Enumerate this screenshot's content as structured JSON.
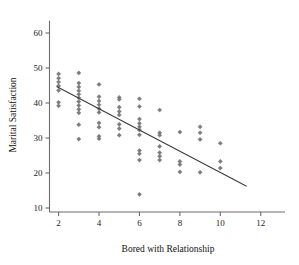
{
  "chart_data": {
    "type": "scatter",
    "title": "",
    "xlabel": "Bored with Relationship",
    "ylabel": "Marital Satisfaction",
    "xlim": [
      1.55,
      13.2
    ],
    "ylim": [
      7.0,
      63.5
    ],
    "xticks": [
      2,
      4,
      6,
      8,
      10,
      12
    ],
    "xtick_labels": [
      "2",
      "4",
      "6",
      "8",
      "10",
      "12"
    ],
    "yticks": [
      10,
      20,
      30,
      40,
      50,
      60
    ],
    "ytick_labels": [
      "10",
      "20",
      "30",
      "40",
      "50",
      "60"
    ],
    "grid": false,
    "legend": null,
    "marker": "diamond",
    "marker_color": "#7d7d7d",
    "points": [
      {
        "x": 2,
        "y": 48.3
      },
      {
        "x": 2,
        "y": 47.1
      },
      {
        "x": 2,
        "y": 46.0
      },
      {
        "x": 2,
        "y": 44.9
      },
      {
        "x": 2,
        "y": 43.6
      },
      {
        "x": 2,
        "y": 40.2
      },
      {
        "x": 2,
        "y": 39.2
      },
      {
        "x": 3,
        "y": 48.6
      },
      {
        "x": 3,
        "y": 45.7
      },
      {
        "x": 3,
        "y": 44.6
      },
      {
        "x": 3,
        "y": 43.5
      },
      {
        "x": 3,
        "y": 42.5
      },
      {
        "x": 3,
        "y": 41.5
      },
      {
        "x": 3,
        "y": 40.4
      },
      {
        "x": 3,
        "y": 39.3
      },
      {
        "x": 3,
        "y": 38.2
      },
      {
        "x": 3,
        "y": 37.2
      },
      {
        "x": 3,
        "y": 33.8
      },
      {
        "x": 3,
        "y": 29.7
      },
      {
        "x": 4,
        "y": 45.3
      },
      {
        "x": 4,
        "y": 41.8
      },
      {
        "x": 4,
        "y": 40.6
      },
      {
        "x": 4,
        "y": 39.5
      },
      {
        "x": 4,
        "y": 38.4
      },
      {
        "x": 4,
        "y": 37.3
      },
      {
        "x": 4,
        "y": 34.3
      },
      {
        "x": 4,
        "y": 33.1
      },
      {
        "x": 4,
        "y": 30.5
      },
      {
        "x": 4,
        "y": 29.8
      },
      {
        "x": 5,
        "y": 41.6
      },
      {
        "x": 5,
        "y": 41.0
      },
      {
        "x": 5,
        "y": 38.8
      },
      {
        "x": 5,
        "y": 37.6
      },
      {
        "x": 5,
        "y": 36.6
      },
      {
        "x": 5,
        "y": 33.9
      },
      {
        "x": 5,
        "y": 32.7
      },
      {
        "x": 5,
        "y": 30.8
      },
      {
        "x": 6,
        "y": 41.2
      },
      {
        "x": 6,
        "y": 39.0
      },
      {
        "x": 6,
        "y": 35.4
      },
      {
        "x": 6,
        "y": 34.2
      },
      {
        "x": 6,
        "y": 33.2
      },
      {
        "x": 6,
        "y": 32.3
      },
      {
        "x": 6,
        "y": 30.9
      },
      {
        "x": 6,
        "y": 26.4
      },
      {
        "x": 6,
        "y": 25.5
      },
      {
        "x": 6,
        "y": 23.7
      },
      {
        "x": 6,
        "y": 13.9
      },
      {
        "x": 7,
        "y": 38.0
      },
      {
        "x": 7,
        "y": 31.5
      },
      {
        "x": 7,
        "y": 30.8
      },
      {
        "x": 7,
        "y": 27.6
      },
      {
        "x": 7,
        "y": 25.8
      },
      {
        "x": 7,
        "y": 24.8
      },
      {
        "x": 7,
        "y": 23.7
      },
      {
        "x": 8,
        "y": 31.7
      },
      {
        "x": 8,
        "y": 23.3
      },
      {
        "x": 8,
        "y": 22.4
      },
      {
        "x": 8,
        "y": 20.3
      },
      {
        "x": 9,
        "y": 33.2
      },
      {
        "x": 9,
        "y": 31.5
      },
      {
        "x": 9,
        "y": 29.6
      },
      {
        "x": 9,
        "y": 20.2
      },
      {
        "x": 10,
        "y": 28.5
      },
      {
        "x": 10,
        "y": 23.3
      },
      {
        "x": 10,
        "y": 21.4
      }
    ],
    "fit_line": {
      "label": "least-squares regression line",
      "x_start": 1.9,
      "y_start": 44.7,
      "x_end": 11.3,
      "y_end": 16.2,
      "color": "#3a3a3a"
    }
  }
}
